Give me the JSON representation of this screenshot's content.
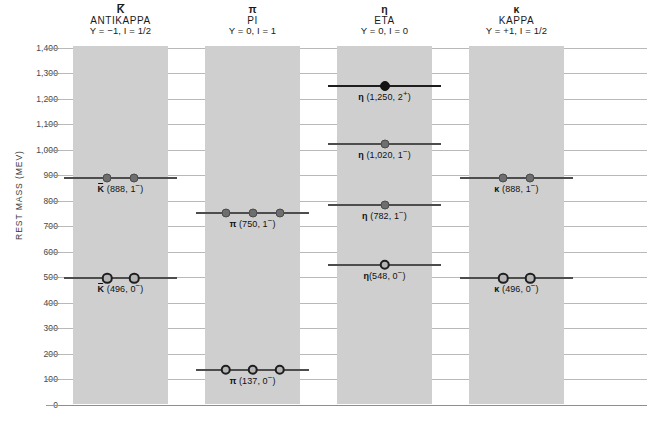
{
  "axis": {
    "y_label": "REST MASS (MEV)",
    "y_ticks": [
      "1,400",
      "1,300",
      "1,200",
      "1,100",
      "1,000",
      "900",
      "800",
      "700",
      "600",
      "500",
      "400",
      "300",
      "200",
      "100",
      "0"
    ],
    "y_min": 0,
    "y_max": 1400
  },
  "columns": [
    {
      "symbol": "K",
      "overbar": true,
      "name": "ANTIKAPPA",
      "quantum": "Y = −1, I = 1/2"
    },
    {
      "symbol": "π",
      "overbar": false,
      "name": "PI",
      "quantum": "Y = 0, I = 1"
    },
    {
      "symbol": "η",
      "overbar": false,
      "name": "ETA",
      "quantum": "Y = 0, I = 0"
    },
    {
      "symbol": "κ",
      "overbar": false,
      "name": "KAPPA",
      "quantum": "Y = +1, I = 1/2"
    }
  ],
  "chart_data": {
    "type": "scatter",
    "title": "",
    "xlabel": "",
    "ylabel": "REST MASS (MEV)",
    "ylim": [
      0,
      1400
    ],
    "ytick_values": [
      1400,
      1300,
      1200,
      1100,
      1000,
      900,
      800,
      700,
      600,
      500,
      400,
      300,
      200,
      100,
      0
    ],
    "grid": true,
    "legend": "none",
    "categories": [
      "ANTIKAPPA",
      "PI",
      "ETA",
      "KAPPA"
    ],
    "series": [
      {
        "name": "ANTIKAPPA",
        "column_symbol": "K̄",
        "Y": -1,
        "I": "1/2",
        "levels": [
          {
            "mass": 888,
            "spin_parity": "1−",
            "label_symbol": "K",
            "label_overbar": true,
            "label": "K̄ (888, 1−)",
            "label_text": " (888, 1",
            "label_sup": "−",
            "label_tail": ")",
            "marker": "filled",
            "marker_count": 2,
            "line": "normal"
          },
          {
            "mass": 496,
            "spin_parity": "0−",
            "label_symbol": "K",
            "label_overbar": true,
            "label": "K̄ (496, 0−)",
            "label_text": " (496, 0",
            "label_sup": "−",
            "label_tail": ")",
            "marker": "open",
            "marker_count": 2,
            "line": "normal"
          }
        ]
      },
      {
        "name": "PI",
        "column_symbol": "π",
        "Y": 0,
        "I": "1",
        "levels": [
          {
            "mass": 750,
            "spin_parity": "1−",
            "label_symbol": "π",
            "label_overbar": false,
            "label": "π (750, 1−)",
            "label_text": " (750, 1",
            "label_sup": "−",
            "label_tail": ")",
            "marker": "filled",
            "marker_count": 3,
            "line": "normal"
          },
          {
            "mass": 137,
            "spin_parity": "0−",
            "label_symbol": "π",
            "label_overbar": false,
            "label": "π (137, 0−)",
            "label_text": " (137, 0",
            "label_sup": "−",
            "label_tail": ")",
            "marker": "open",
            "marker_count": 3,
            "line": "normal"
          }
        ]
      },
      {
        "name": "ETA",
        "column_symbol": "η",
        "Y": 0,
        "I": "0",
        "levels": [
          {
            "mass": 1250,
            "spin_parity": "2+",
            "label_symbol": "η",
            "label_overbar": false,
            "label": "η (1,250, 2+)",
            "label_text": " (1,250, 2",
            "label_sup": "+",
            "label_tail": ")",
            "marker": "black",
            "marker_count": 1,
            "line": "dark"
          },
          {
            "mass": 1020,
            "spin_parity": "1−",
            "label_symbol": "η",
            "label_overbar": false,
            "label": "η (1,020, 1−)",
            "label_text": " (1,020, 1",
            "label_sup": "−",
            "label_tail": ")",
            "marker": "filled",
            "marker_count": 1,
            "line": "normal"
          },
          {
            "mass": 782,
            "spin_parity": "1−",
            "label_symbol": "η",
            "label_overbar": false,
            "label": "η (782, 1−)",
            "label_text": " (782, 1",
            "label_sup": "−",
            "label_tail": ")",
            "marker": "filled",
            "marker_count": 1,
            "line": "normal"
          },
          {
            "mass": 548,
            "spin_parity": "0−",
            "label_symbol": "η",
            "label_overbar": false,
            "label": "η (548, 0−)",
            "label_text": "(548,  0",
            "label_sup": "−",
            "label_tail": ")",
            "marker": "open",
            "marker_count": 1,
            "line": "normal"
          }
        ]
      },
      {
        "name": "KAPPA",
        "column_symbol": "κ",
        "Y": 1,
        "I": "1/2",
        "levels": [
          {
            "mass": 888,
            "spin_parity": "1−",
            "label_symbol": "κ",
            "label_overbar": false,
            "label": "κ (888, 1−)",
            "label_text": " (888, 1",
            "label_sup": "−",
            "label_tail": ")",
            "marker": "filled",
            "marker_count": 2,
            "line": "normal"
          },
          {
            "mass": 496,
            "spin_parity": "0−",
            "label_symbol": "κ",
            "label_overbar": false,
            "label": "κ (496, 0−)",
            "label_text": " (496, 0",
            "label_sup": "−",
            "label_tail": ")",
            "marker": "open",
            "marker_count": 2,
            "line": "normal"
          }
        ]
      }
    ]
  }
}
